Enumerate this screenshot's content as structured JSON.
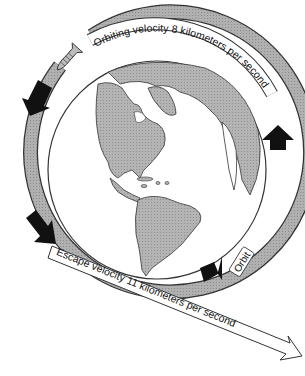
{
  "diagram": {
    "labels": {
      "orbiting_velocity": "Orbiting velocity 8 kilometers per second",
      "escape_velocity": "Escape velocity 11 kilometers per second",
      "orbit": "Orbit"
    },
    "elements": {
      "earth": "Earth globe showing the Americas and Greenland",
      "rocket": "Rocket / spacecraft entering orbit",
      "orbit_ring": "Shaded orbit band around Earth",
      "direction_arrows": 4
    },
    "colors": {
      "land": "#a9a9a9",
      "ocean": "#ffffff",
      "orbit_band": "#a6a6a6",
      "arrow": "#111111",
      "outline": "#333333"
    }
  }
}
